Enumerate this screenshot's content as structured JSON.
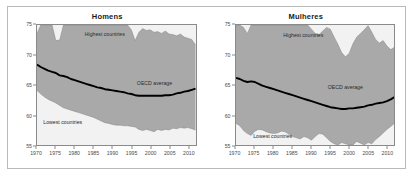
{
  "figure": {
    "panels": [
      {
        "key": "homens",
        "title": "Homens",
        "annotations": {
          "highest": "Highest countries",
          "lowest": "Lowest countries",
          "average": "OECD average"
        }
      },
      {
        "key": "mulheres",
        "title": "Mulheres",
        "annotations": {
          "highest": "Highest countries",
          "lowest": "Lowest countries",
          "average": "OECD average"
        }
      }
    ],
    "axis": {
      "y_ticks": [
        "75",
        "70",
        "65",
        "60",
        "55"
      ],
      "x_ticks": [
        "1970",
        "1975",
        "1980",
        "1985",
        "1990",
        "1995",
        "2000",
        "2005",
        "2010"
      ]
    },
    "colors": {
      "band_fill": "#a9a9a9",
      "plot_background": "#f2f2f2",
      "average_line": "#000000",
      "axis": "#8a8a8a",
      "frame": "#b9b9b9"
    }
  },
  "chart_data": [
    {
      "type": "area",
      "title": "Homens",
      "xlabel": "",
      "ylabel": "",
      "xlim": [
        1970,
        2012
      ],
      "ylim": [
        55,
        75
      ],
      "grid": false,
      "legend": "in-plot annotations",
      "annotations": [
        {
          "text": "Highest countries",
          "x": 1988,
          "y": 73.4
        },
        {
          "text": "OECD average",
          "x": 2001,
          "y": 65.4
        },
        {
          "text": "Lowest countries",
          "x": 1977,
          "y": 59.0
        }
      ],
      "x": [
        1970,
        1971,
        1972,
        1973,
        1974,
        1975,
        1976,
        1977,
        1978,
        1979,
        1980,
        1981,
        1982,
        1983,
        1984,
        1985,
        1986,
        1987,
        1988,
        1989,
        1990,
        1991,
        1992,
        1993,
        1994,
        1995,
        1996,
        1997,
        1998,
        1999,
        2000,
        2001,
        2002,
        2003,
        2004,
        2005,
        2006,
        2007,
        2008,
        2009,
        2010,
        2011,
        2012
      ],
      "series": [
        {
          "name": "Highest countries",
          "values": [
            73.6,
            75.0,
            75.0,
            75.0,
            75.0,
            72.4,
            72.5,
            75.0,
            75.0,
            75.0,
            75.0,
            75.0,
            75.0,
            75.0,
            75.0,
            75.0,
            75.0,
            75.0,
            75.0,
            75.0,
            75.0,
            75.0,
            75.0,
            75.0,
            75.0,
            74.2,
            72.4,
            73.8,
            74.4,
            74.1,
            74.2,
            73.8,
            73.9,
            73.6,
            74.0,
            73.5,
            73.4,
            73.2,
            73.5,
            73.0,
            72.8,
            72.6,
            71.7
          ]
        },
        {
          "name": "OECD average",
          "values": [
            68.4,
            68.0,
            67.7,
            67.4,
            67.2,
            67.0,
            66.6,
            66.5,
            66.3,
            66.0,
            65.8,
            65.6,
            65.4,
            65.2,
            65.0,
            64.8,
            64.6,
            64.5,
            64.3,
            64.2,
            64.1,
            64.0,
            63.9,
            63.8,
            63.6,
            63.5,
            63.3,
            63.2,
            63.2,
            63.2,
            63.2,
            63.2,
            63.2,
            63.2,
            63.3,
            63.3,
            63.4,
            63.6,
            63.7,
            63.9,
            64.0,
            64.2,
            64.4
          ]
        },
        {
          "name": "Lowest countries",
          "values": [
            64.1,
            63.5,
            63.0,
            62.6,
            62.3,
            62.0,
            61.6,
            61.2,
            61.0,
            60.8,
            60.6,
            60.4,
            60.2,
            60.0,
            59.8,
            59.6,
            59.3,
            59.0,
            58.7,
            58.6,
            58.4,
            58.3,
            58.3,
            58.2,
            58.2,
            58.1,
            58.0,
            57.6,
            57.4,
            57.6,
            57.4,
            57.2,
            57.6,
            57.4,
            57.6,
            57.5,
            57.8,
            57.7,
            57.9,
            57.8,
            57.9,
            57.7,
            57.5
          ]
        }
      ]
    },
    {
      "type": "area",
      "title": "Mulheres",
      "xlabel": "",
      "ylabel": "",
      "xlim": [
        1970,
        2012
      ],
      "ylim": [
        55,
        75
      ],
      "grid": false,
      "legend": "in-plot annotations",
      "annotations": [
        {
          "text": "Highest countries",
          "x": 1988,
          "y": 73.2
        },
        {
          "text": "OECD average",
          "x": 1999,
          "y": 64.6
        },
        {
          "text": "Lowest countries",
          "x": 1980,
          "y": 56.6
        },
        {
          "text": "75",
          "x": 1970,
          "y": 75
        }
      ],
      "x": [
        1970,
        1971,
        1972,
        1973,
        1974,
        1975,
        1976,
        1977,
        1978,
        1979,
        1980,
        1981,
        1982,
        1983,
        1984,
        1985,
        1986,
        1987,
        1988,
        1989,
        1990,
        1991,
        1992,
        1993,
        1994,
        1995,
        1996,
        1997,
        1998,
        1999,
        2000,
        2001,
        2002,
        2003,
        2004,
        2005,
        2006,
        2007,
        2008,
        2009,
        2010,
        2011,
        2012
      ],
      "series": [
        {
          "name": "Highest countries",
          "values": [
            75.0,
            75.0,
            74.6,
            73.6,
            75.0,
            75.0,
            75.0,
            75.0,
            75.0,
            75.0,
            75.0,
            75.0,
            75.0,
            75.0,
            75.0,
            75.0,
            75.0,
            75.0,
            75.0,
            75.0,
            74.3,
            73.6,
            73.4,
            74.0,
            74.6,
            74.3,
            73.0,
            71.8,
            70.4,
            69.7,
            70.3,
            71.9,
            73.0,
            73.6,
            74.2,
            74.9,
            73.8,
            72.6,
            72.0,
            72.4,
            71.5,
            70.9,
            71.3
          ]
        },
        {
          "name": "OECD average",
          "values": [
            66.2,
            66.0,
            65.7,
            65.5,
            65.6,
            65.5,
            65.2,
            64.9,
            64.7,
            64.5,
            64.3,
            64.1,
            63.9,
            63.7,
            63.5,
            63.3,
            63.1,
            62.9,
            62.7,
            62.5,
            62.3,
            62.1,
            61.9,
            61.7,
            61.5,
            61.3,
            61.2,
            61.1,
            61.0,
            61.0,
            61.1,
            61.1,
            61.2,
            61.3,
            61.4,
            61.6,
            61.7,
            61.9,
            62.0,
            62.1,
            62.3,
            62.6,
            63.0
          ]
        },
        {
          "name": "Lowest countries",
          "values": [
            58.6,
            58.2,
            57.4,
            56.9,
            56.6,
            57.3,
            57.6,
            57.5,
            57.2,
            57.0,
            56.9,
            57.0,
            57.3,
            57.2,
            56.8,
            56.4,
            56.2,
            56.0,
            56.4,
            56.2,
            55.8,
            56.4,
            56.9,
            56.8,
            56.2,
            55.6,
            55.2,
            55.0,
            55.4,
            55.2,
            55.0,
            55.0,
            55.6,
            55.3,
            55.0,
            55.4,
            55.2,
            55.9,
            56.4,
            57.0,
            57.6,
            58.1,
            58.6
          ]
        }
      ]
    }
  ]
}
